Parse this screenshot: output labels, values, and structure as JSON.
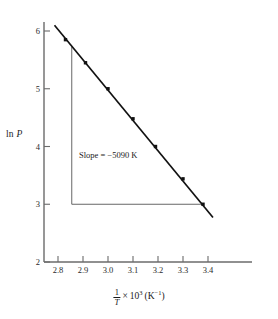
{
  "chart_data": {
    "type": "scatter",
    "title": "",
    "xlabel": "1/T x 10^3 (K^-1)",
    "ylabel": "ln P",
    "xlim": [
      2.74,
      3.44
    ],
    "ylim": [
      2.0,
      6.3
    ],
    "grid": false,
    "legend": null,
    "x_ticks": [
      "2.8",
      "2.9",
      "3.0",
      "3.1",
      "3.2",
      "3.3",
      "3.4"
    ],
    "x_tick_values": [
      2.8,
      2.9,
      3.0,
      3.1,
      3.2,
      3.3,
      3.4
    ],
    "y_ticks": [
      "2",
      "3",
      "4",
      "5",
      "6"
    ],
    "y_tick_values": [
      2,
      3,
      4,
      5,
      6
    ],
    "x": [
      2.83,
      2.91,
      3.0,
      3.1,
      3.19,
      3.3,
      3.38
    ],
    "y": [
      5.85,
      5.45,
      5.0,
      4.48,
      4.0,
      3.44,
      3.0
    ],
    "series": [
      {
        "name": "ln P data",
        "marker": "square",
        "color": "#111111",
        "points": [
          {
            "x": 2.83,
            "y": 5.85
          },
          {
            "x": 2.91,
            "y": 5.45
          },
          {
            "x": 3.0,
            "y": 5.0
          },
          {
            "x": 3.1,
            "y": 4.48
          },
          {
            "x": 3.19,
            "y": 4.0
          },
          {
            "x": 3.3,
            "y": 3.44
          },
          {
            "x": 3.38,
            "y": 3.0
          }
        ]
      }
    ],
    "fit_line": {
      "slope": -5090,
      "slope_units": "K",
      "x_start": 2.786,
      "y_start": 6.1,
      "x_end": 3.42,
      "y_end": 2.77,
      "color": "#111111"
    },
    "slope_triangle": {
      "x_vertical": 2.855,
      "y_top": 5.73,
      "y_bottom": 3.0,
      "x_right": 3.38,
      "color": "#555555"
    },
    "annotations": [
      {
        "name": "slope-label",
        "text": "Slope = −5090 K",
        "x": 2.915,
        "y": 4.05
      }
    ]
  },
  "labels": {
    "y_axis_title_prefix": "ln ",
    "y_axis_title_var": "P",
    "x_axis_numerator": "1",
    "x_axis_denominator": "T",
    "x_axis_times": "×",
    "x_axis_base": "10",
    "x_axis_exponent": "3",
    "x_axis_units_open": "(K",
    "x_axis_units_exponent": "−1",
    "x_axis_units_close": ")"
  },
  "colors": {
    "axis": "#6b6b6b",
    "line": "#111111",
    "marker": "#111111",
    "triangle": "#555555",
    "text": "#1a1a1a",
    "background": "#ffffff"
  }
}
